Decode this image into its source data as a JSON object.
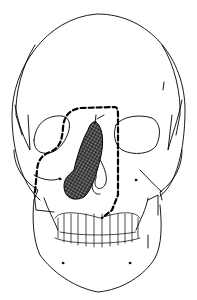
{
  "figure": {
    "line_color": "#000000",
    "background": "#ffffff",
    "lesion_fill": "#555555",
    "elements": [
      "cranium-outline",
      "orbits",
      "nasal-cavity",
      "lesion",
      "dashed-incision-outline",
      "maxilla",
      "teeth",
      "mandible"
    ]
  }
}
